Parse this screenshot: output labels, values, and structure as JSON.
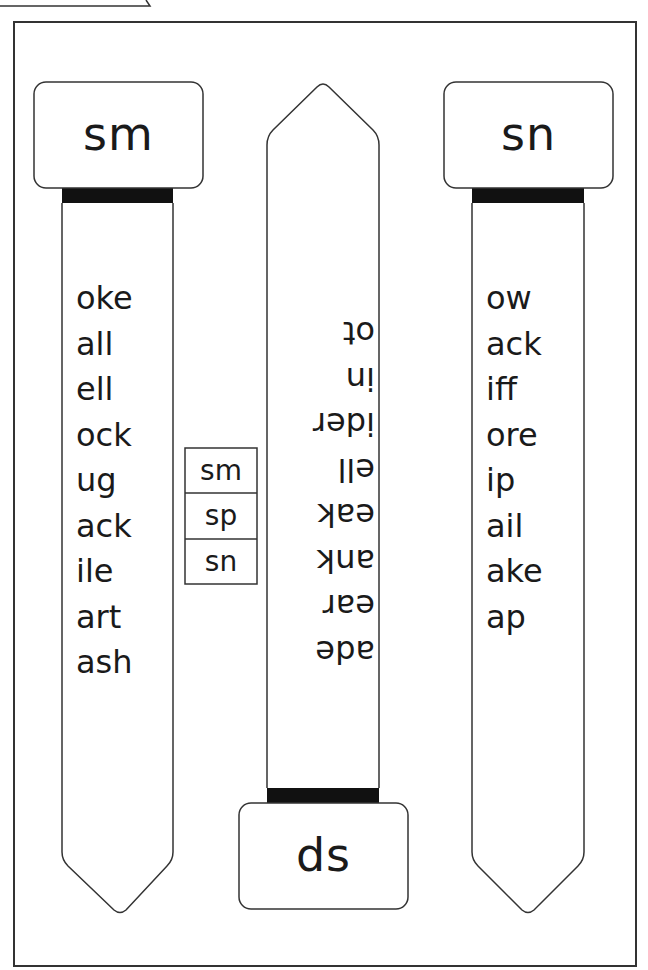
{
  "page": {
    "colors": {
      "outline": "#333333",
      "band": "#111111",
      "text": "#1a1a1a",
      "background": "#ffffff"
    }
  },
  "left_slider": {
    "header": "sm",
    "words": [
      "oke",
      "all",
      "ell",
      "ock",
      "ug",
      "ack",
      "ile",
      "art",
      "ash"
    ]
  },
  "center_slider": {
    "header": "ds",
    "orientation": "upside-down",
    "words": [
      "ot",
      "in",
      "ider",
      "ell",
      "eak",
      "ank",
      "ear",
      "ade"
    ]
  },
  "right_slider": {
    "header": "sn",
    "words": [
      "ow",
      "ack",
      "iff",
      "ore",
      "ip",
      "ail",
      "ake",
      "ap"
    ]
  },
  "blend_box": {
    "items": [
      "sm",
      "sp",
      "sn"
    ]
  }
}
